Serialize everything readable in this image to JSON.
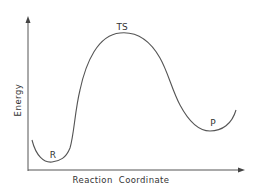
{
  "diagram": {
    "type": "reaction-energy-profile",
    "y_axis_label": "Energy",
    "x_axis_label": "Reaction Coordinate",
    "points": {
      "reactant": "R",
      "transition_state": "TS",
      "product": "P"
    },
    "colors": {
      "line": "#555555",
      "text": "#333333",
      "background": "#ffffff"
    }
  }
}
